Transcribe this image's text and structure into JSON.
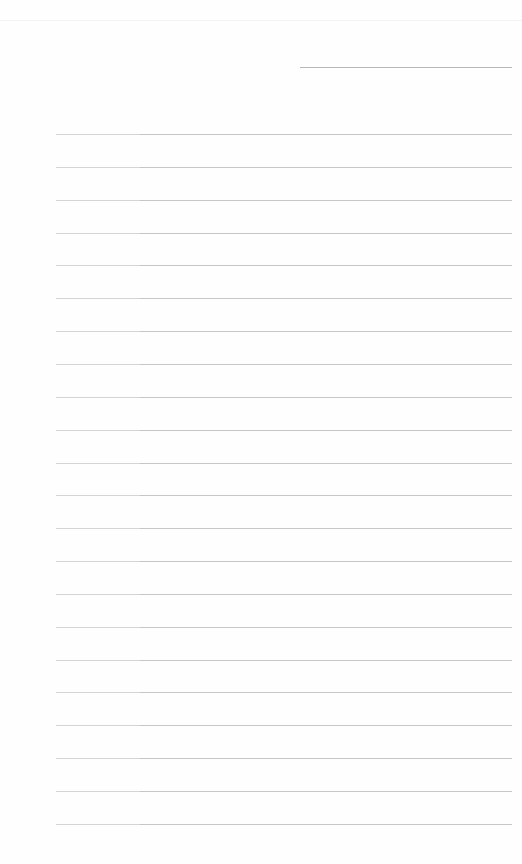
{
  "document": {
    "type": "lined-paper",
    "background_color": "#fefefe",
    "line_color": "#c6c6c6",
    "header_line": {
      "x": 300,
      "y": 67,
      "width": 212
    },
    "ruled_lines": {
      "count": 22,
      "x": 56,
      "width": 456,
      "first_y": 134,
      "spacing": 32.85
    }
  }
}
